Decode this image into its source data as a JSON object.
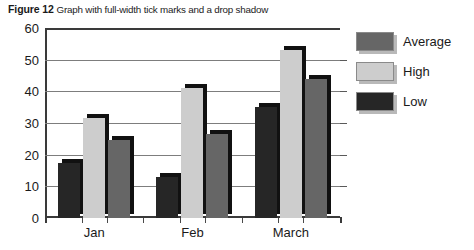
{
  "caption": {
    "figure_label": "Figure 12",
    "text": "Graph with full-width tick marks and a drop shadow"
  },
  "chart_data": {
    "type": "bar",
    "title": "",
    "xlabel": "",
    "ylabel": "",
    "categories": [
      "Jan",
      "Feb",
      "March"
    ],
    "series": [
      {
        "name": "Low",
        "color": "#262626",
        "values": [
          17.5,
          13,
          35
        ]
      },
      {
        "name": "High",
        "color": "#cdcdcd",
        "values": [
          31.5,
          41,
          53
        ]
      },
      {
        "name": "Average",
        "color": "#666666",
        "values": [
          24.5,
          26.5,
          44
        ]
      }
    ],
    "legend_order": [
      "Average",
      "High",
      "Low"
    ],
    "legend_position": "right",
    "ylim": [
      0,
      60
    ],
    "yticks": [
      0,
      10,
      20,
      30,
      40,
      50,
      60
    ],
    "ytick_labels": [
      "0",
      "10",
      "20",
      "30",
      "40",
      "50",
      "60"
    ],
    "grid": true,
    "grid_style": "full-width tick marks",
    "drop_shadow": true,
    "shadow_color": "#111111"
  },
  "legend": {
    "items": [
      {
        "label": "Average",
        "color": "#666666"
      },
      {
        "label": "High",
        "color": "#cdcdcd"
      },
      {
        "label": "Low",
        "color": "#262626"
      }
    ]
  }
}
